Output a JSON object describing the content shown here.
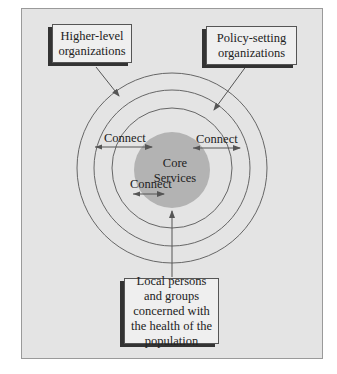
{
  "diagram": {
    "boxes": {
      "higher_level": "Higher-level organizations",
      "policy_setting": "Policy-setting organizations",
      "local": "Local persons and groups concerned with the health of the population"
    },
    "core": {
      "line1": "Core",
      "line2": "Services"
    },
    "connect_labels": [
      "Connect",
      "Connect",
      "Connect"
    ],
    "colors": {
      "background": "#e4e4e4",
      "core_fill": "#b3b3b3",
      "ring_stroke": "#666666"
    }
  }
}
